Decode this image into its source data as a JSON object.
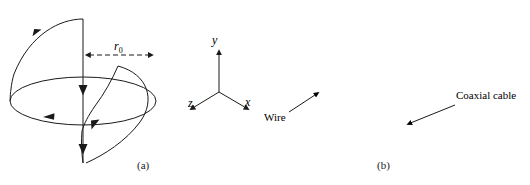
{
  "figure": {
    "panels": [
      {
        "id": "a",
        "caption": "(a)",
        "type": "line-drawing",
        "description": "Schematic of a spherical helix / loop antenna geometry with current-direction arrows, radius marker r0, and a coordinate triad",
        "radius_label": {
          "symbol": "r",
          "subscript": "0",
          "full": "r0"
        },
        "axes": {
          "y": "y",
          "x": "x",
          "z": "z"
        },
        "stroke_color": "#1a1a1a",
        "background_color": "#ffffff"
      },
      {
        "id": "b",
        "caption": "(b)",
        "type": "photograph",
        "description": "Photograph of the fabricated wire antenna prototype fed by a coaxial cable",
        "annotations": [
          {
            "label": "Wire",
            "arrow": "points up-right into the photo toward the wire loop"
          },
          {
            "label": "Coaxial cable",
            "arrow": "points down-left into the photo toward the feeding cable"
          }
        ],
        "photo_background_color": "#8b8b8b",
        "wire_color": "#3a3a3a"
      }
    ]
  }
}
